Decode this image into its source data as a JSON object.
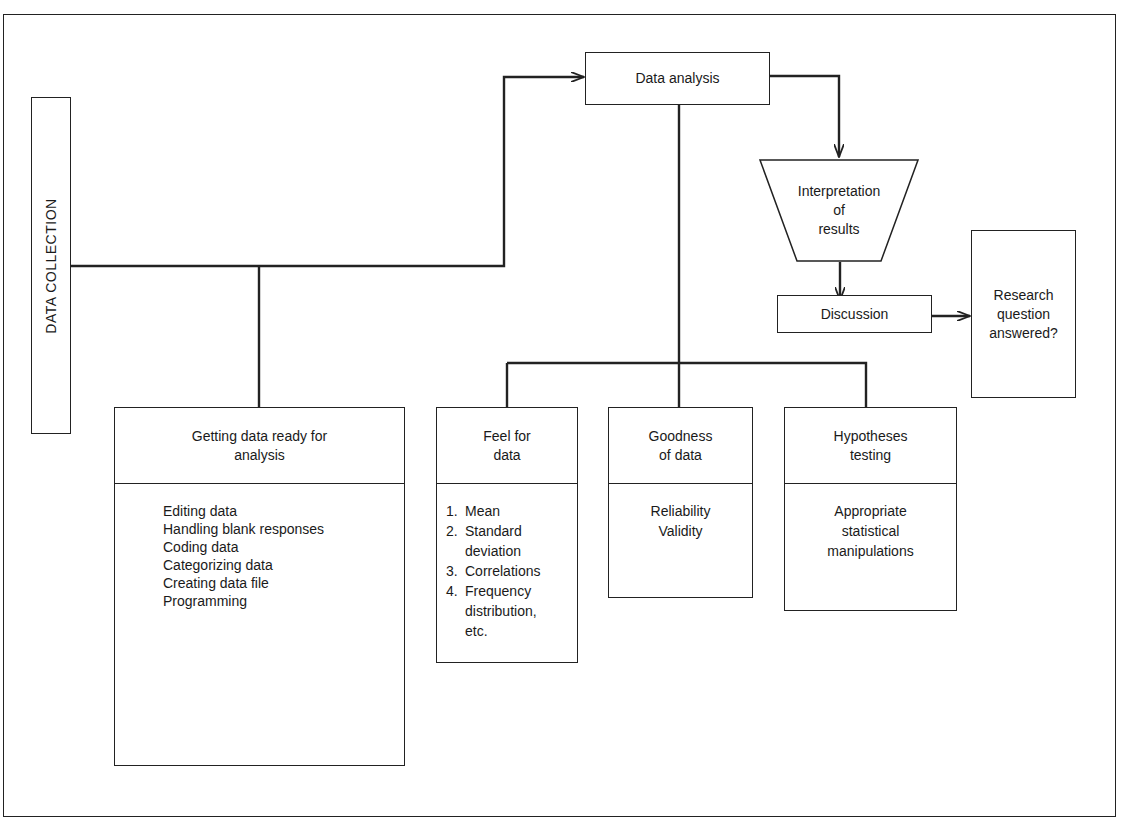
{
  "diagram": {
    "type": "flowchart",
    "title": "",
    "nodes": {
      "data_collection": {
        "label": "DATA COLLECTION"
      },
      "data_analysis": {
        "label": "Data analysis"
      },
      "interpretation": {
        "lines": [
          "Interpretation",
          "of",
          "results"
        ]
      },
      "discussion": {
        "label": "Discussion"
      },
      "research_question": {
        "lines": [
          "Research",
          "question",
          "answered?"
        ]
      },
      "getting_ready": {
        "title_lines": [
          "Getting data ready for",
          "analysis"
        ],
        "items": [
          "Editing data",
          "Handling blank responses",
          "Coding data",
          "Categorizing data",
          "Creating data file",
          "Programming"
        ]
      },
      "feel_for_data": {
        "title_lines": [
          "Feel for",
          "data"
        ],
        "items": [
          {
            "num": "1.",
            "lines": [
              "Mean"
            ]
          },
          {
            "num": "2.",
            "lines": [
              "Standard",
              "deviation"
            ]
          },
          {
            "num": "3.",
            "lines": [
              "Correlations"
            ]
          },
          {
            "num": "4.",
            "lines": [
              "Frequency",
              "distribution,",
              "etc."
            ]
          }
        ]
      },
      "goodness_of_data": {
        "title_lines": [
          "Goodness",
          "of data"
        ],
        "items": [
          "Reliability",
          "Validity"
        ]
      },
      "hypotheses_testing": {
        "title_lines": [
          "Hypotheses",
          "testing"
        ],
        "items": [
          "Appropriate",
          "statistical",
          "manipulations"
        ]
      }
    },
    "edges": [
      {
        "from": "data_collection",
        "to": "getting_ready",
        "arrow": false
      },
      {
        "from": "data_collection",
        "to": "data_analysis",
        "arrow": true
      },
      {
        "from": "data_analysis",
        "to": "interpretation",
        "arrow": true
      },
      {
        "from": "interpretation",
        "to": "discussion",
        "arrow": true
      },
      {
        "from": "discussion",
        "to": "research_question",
        "arrow": true
      },
      {
        "from": "data_analysis",
        "to": "feel_for_data",
        "arrow": false
      },
      {
        "from": "data_analysis",
        "to": "goodness_of_data",
        "arrow": false
      },
      {
        "from": "data_analysis",
        "to": "hypotheses_testing",
        "arrow": false
      }
    ],
    "colors": {
      "stroke": "#222222",
      "background": "#ffffff",
      "text": "#1a1a1a"
    }
  }
}
